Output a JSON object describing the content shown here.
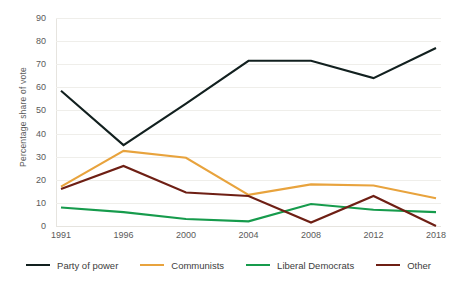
{
  "chart_data": {
    "type": "line",
    "title": "",
    "xlabel": "",
    "ylabel": "Percentage share of vote",
    "x": [
      "1991",
      "1996",
      "2000",
      "2004",
      "2008",
      "2012",
      "2018"
    ],
    "ylim": [
      0,
      90
    ],
    "yticks": [
      0,
      10,
      20,
      30,
      40,
      50,
      60,
      70,
      80,
      90
    ],
    "ytick_labels": [
      "0",
      "10",
      "20",
      "30",
      "40",
      "50",
      "60",
      "70",
      "80",
      "90"
    ],
    "grid": "horizontal",
    "legend_position": "bottom",
    "series": [
      {
        "name": "Party of power",
        "color": "#12201f",
        "values": [
          58.5,
          35.0,
          53.0,
          71.5,
          71.5,
          64.0,
          77.0
        ]
      },
      {
        "name": "Communists",
        "color": "#e8a33d",
        "values": [
          17.0,
          32.5,
          29.5,
          13.5,
          18.0,
          17.5,
          12.0
        ]
      },
      {
        "name": "Liberal Democrats",
        "color": "#169b4c",
        "values": [
          8.0,
          6.0,
          3.0,
          2.0,
          9.5,
          7.0,
          6.0
        ]
      },
      {
        "name": "Other",
        "color": "#6e1f14",
        "values": [
          16.0,
          26.0,
          14.5,
          13.0,
          1.5,
          13.0,
          0.0
        ]
      }
    ]
  },
  "colors": {
    "background": "#ffffff",
    "gridline": "#efeeea",
    "axis": "#e6e4df",
    "text": "#5a5a5a"
  }
}
